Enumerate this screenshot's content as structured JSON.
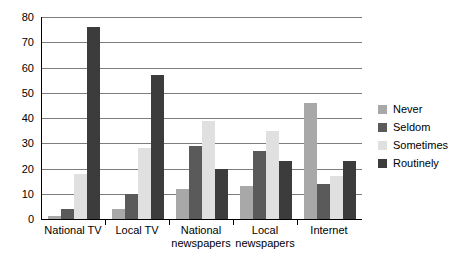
{
  "chart_data": {
    "type": "bar",
    "title": "",
    "subtitle": "",
    "xlabel": "",
    "ylabel": "",
    "grouping": "grouped",
    "grid": true,
    "grid_axis": "y",
    "legend_position": "right",
    "ylim": [
      0,
      80
    ],
    "yticks": [
      0,
      10,
      20,
      30,
      40,
      50,
      60,
      70,
      80
    ],
    "ytick_labels": [
      "0",
      "10",
      "20",
      "30",
      "40",
      "50",
      "60",
      "70",
      "80"
    ],
    "categories": [
      "National TV",
      "Local TV",
      "National\nnewspapers",
      "Local\nnewspapers",
      "Internet"
    ],
    "series": [
      {
        "name": "Never",
        "color": "#a8a8a8",
        "values": [
          1,
          4,
          12,
          13,
          46
        ]
      },
      {
        "name": "Seldom",
        "color": "#5a5a5a",
        "values": [
          4,
          10,
          29,
          27,
          14
        ]
      },
      {
        "name": "Sometimes",
        "color": "#e0e0e0",
        "values": [
          18,
          28,
          39,
          35,
          17
        ]
      },
      {
        "name": "Routinely",
        "color": "#3c3c3c",
        "values": [
          76,
          57,
          20,
          23,
          23
        ]
      }
    ]
  },
  "legend": {
    "items": [
      {
        "label": "Never",
        "color": "#a8a8a8"
      },
      {
        "label": "Seldom",
        "color": "#5a5a5a"
      },
      {
        "label": "Sometimes",
        "color": "#e0e0e0"
      },
      {
        "label": "Routinely",
        "color": "#3c3c3c"
      }
    ]
  },
  "axes": {
    "y_tick_labels": [
      "80",
      "70",
      "60",
      "50",
      "40",
      "30",
      "20",
      "10",
      "0"
    ],
    "x_category_labels": [
      "National TV",
      "Local TV",
      "National\nnewspapers",
      "Local\nnewspapers",
      "Internet"
    ]
  },
  "colors": {
    "gridline": "#7d7d7d",
    "axis": "#000000",
    "background": "#ffffff"
  }
}
